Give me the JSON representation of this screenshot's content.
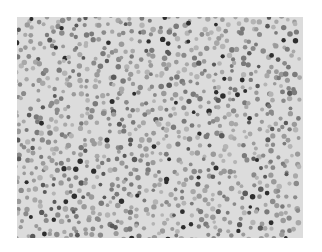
{
  "image": {
    "subject": "grayscale light micrograph of densely scattered cells (blood smear)",
    "frame": {
      "left": 17,
      "top": 17,
      "width": 286,
      "height": 221
    },
    "background_color": "#dcdcdc",
    "page_background": "#ffffff",
    "cell_colors": [
      "#9a9a9a",
      "#8a8a8a",
      "#a8a8a8",
      "#7a7a7a",
      "#b4b4b4",
      "#5a5a5a",
      "#2e2e2e"
    ],
    "cell_radius_range": [
      1.8,
      2.8
    ],
    "cell_spacing": 7.5,
    "seed": 1337
  }
}
